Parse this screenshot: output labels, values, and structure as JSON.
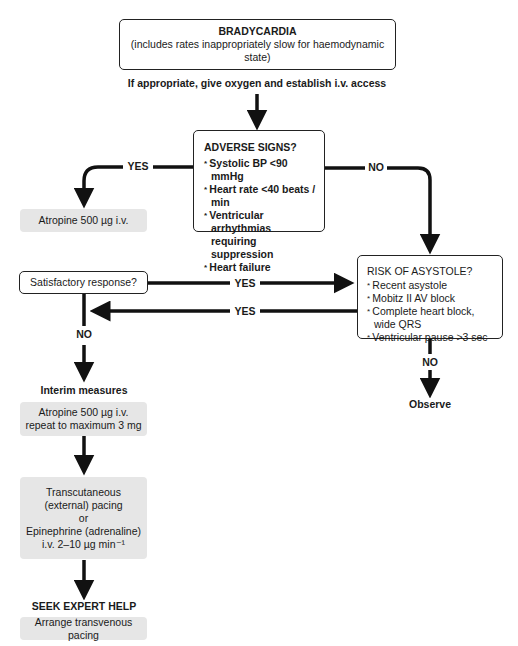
{
  "start": {
    "title": "BRADYCARDIA",
    "subtitle": "(includes rates inappropriately slow for haemodynamic state)"
  },
  "initial_action": "If appropriate, give oxygen and establish i.v. access",
  "adverse_signs": {
    "title": "ADVERSE SIGNS?",
    "items": [
      "Systolic BP <90 mmHg",
      "Heart rate <40 beats / min",
      "Ventricular arrhythmias requiring suppression",
      "Heart failure"
    ]
  },
  "labels": {
    "yes": "YES",
    "no": "NO"
  },
  "atropine_first": "Atropine 500 µg i.v.",
  "satisfactory": "Satisfactory response?",
  "risk_of_asystole": {
    "title": "RISK OF ASYSTOLE?",
    "items": [
      "Recent asystole",
      "Mobitz II AV block",
      "Complete heart block, wide QRS",
      "Ventricular pause >3 sec"
    ]
  },
  "observe": "Observe",
  "interim_measures": "Interim measures",
  "atropine_repeat": {
    "line1": "Atropine 500 µg i.v.",
    "line2": "repeat to maximum 3 mg"
  },
  "pacing": {
    "line1": "Transcutaneous",
    "line2": "(external) pacing",
    "line3": "or",
    "line4": "Epinephrine (adrenaline)",
    "line5": "i.v. 2–10 µg min⁻¹"
  },
  "seek_help": "SEEK EXPERT HELP",
  "transvenous": "Arrange transvenous pacing",
  "colors": {
    "line": "#111111",
    "grey_fill": "#e6e6e6"
  }
}
